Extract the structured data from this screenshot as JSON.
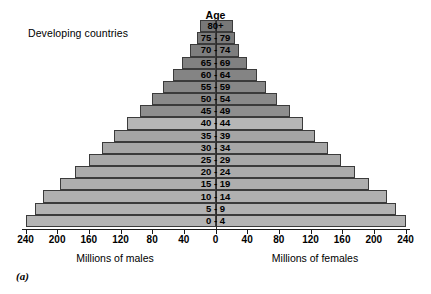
{
  "chart_data": {
    "type": "bar",
    "subtype": "population-pyramid",
    "title": "Age",
    "region_label": "Developing countries",
    "figure_label": "(a)",
    "categories": [
      "0 - 4",
      "5 - 9",
      "10 - 14",
      "15 - 19",
      "20 - 24",
      "25 - 29",
      "30 - 34",
      "35 - 39",
      "40 - 44",
      "45 - 49",
      "50 - 54",
      "55 - 59",
      "60 - 64",
      "65 - 69",
      "70 - 74",
      "75 - 79",
      "80+"
    ],
    "series": [
      {
        "name": "Millions of males",
        "side": "left",
        "axis_caption": "Millions of males",
        "values": [
          240,
          228,
          218,
          196,
          178,
          160,
          144,
          128,
          112,
          96,
          80,
          66,
          54,
          42,
          32,
          24,
          20
        ]
      },
      {
        "name": "Millions of females",
        "side": "right",
        "axis_caption": "Millions of females",
        "values": [
          240,
          228,
          216,
          194,
          176,
          158,
          142,
          126,
          110,
          94,
          78,
          64,
          52,
          40,
          30,
          24,
          22
        ]
      }
    ],
    "xlabel": "",
    "ylabel": "Age",
    "xlim": [
      -240,
      240
    ],
    "x_ticks": [
      240,
      200,
      160,
      120,
      80,
      40,
      0,
      40,
      80,
      120,
      160,
      200,
      240
    ],
    "x_tick_labels": [
      "240",
      "200",
      "160",
      "120",
      "80",
      "40",
      "0",
      "40",
      "80",
      "120",
      "160",
      "200",
      "240"
    ],
    "grid": false,
    "legend": "none",
    "bar_colors": [
      "#b4b4b4",
      "#b2b2b2",
      "#b0b0b0",
      "#aeaeae",
      "#ababab",
      "#a9a9a9",
      "#a7a7a7",
      "#a5a5a5",
      "#b6b6b6",
      "#8e8e8e",
      "#8a8a8a",
      "#878787",
      "#848484",
      "#818181",
      "#7e7e7e",
      "#7b7b7b",
      "#787878"
    ],
    "border_color": "#3b3b3b"
  }
}
